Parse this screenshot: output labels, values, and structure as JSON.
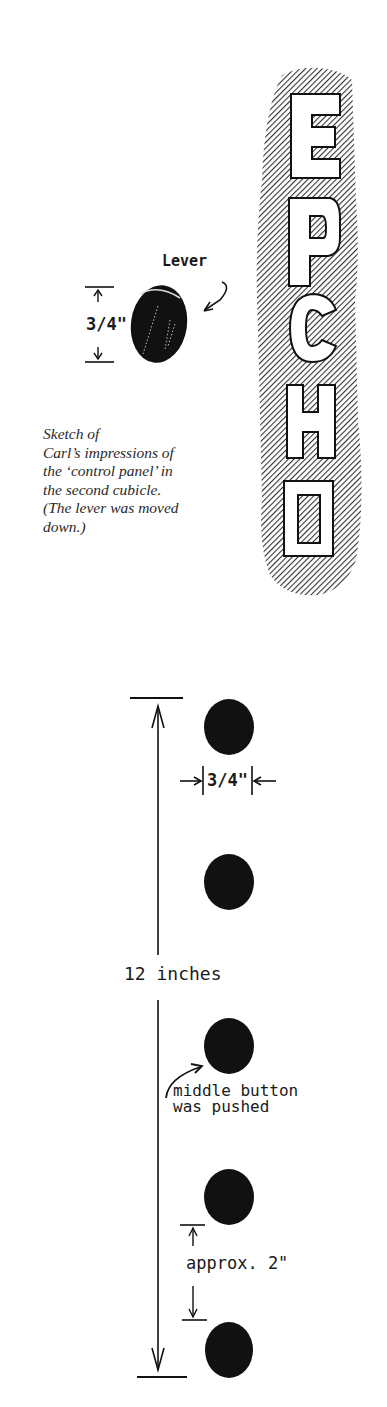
{
  "figure_top": {
    "lever_label": "Lever",
    "lever_dimension": "3/4\"",
    "caption": [
      "Sketch of",
      "Carl’s impressions of",
      "the ‘control panel’ in",
      "the second cubicle.",
      "(The lever was moved",
      "down.)"
    ],
    "sign_letters": [
      "E",
      "P",
      "C",
      "H",
      "O"
    ]
  },
  "figure_bottom": {
    "button_width_label": "3/4\"",
    "total_height_label": "12 inches",
    "middle_button_note": [
      "middle button",
      "was pushed"
    ],
    "spacing_label": "approx. 2\"",
    "button_count": 5
  }
}
